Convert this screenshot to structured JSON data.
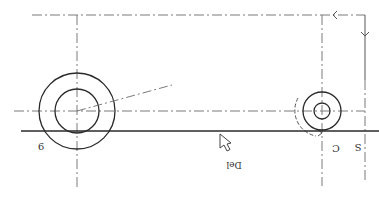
{
  "drawing": {
    "orientation": "rotated-180",
    "colors": {
      "background": "#ffffff",
      "solid_line": "#2a2a2a",
      "center_line": "#7a7a7a",
      "text": "#333333"
    },
    "labels": {
      "left_point": "9",
      "right_center": "C",
      "right_edge": "S",
      "handle_label": "Del"
    },
    "large_circle": {
      "cx": 77,
      "cy": 111,
      "outer_r": 38,
      "inner_r": 22
    },
    "small_circle": {
      "cx": 322,
      "cy": 111,
      "outer_r": 19,
      "inner_r": 8
    },
    "baseline_y": 131,
    "centerline_y": 111,
    "top_line_y": 15,
    "cursor_icon": "arrow-cursor-icon"
  }
}
